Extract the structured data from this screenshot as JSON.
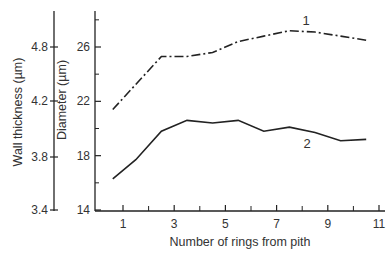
{
  "chart_data": {
    "type": "line",
    "title": "",
    "xlabel": "Number of rings from pith",
    "ylabel_left_outer": "Wall thickness (µm)",
    "ylabel_left_inner": "Diameter (µm)",
    "x_ticks": [
      1,
      3,
      5,
      7,
      9,
      11
    ],
    "x_minor_ticks": [
      2,
      4,
      6,
      8,
      10
    ],
    "xlim": [
      0,
      11
    ],
    "wall_thickness_ticks": [
      "3.4",
      "3.8",
      "4.2",
      "4.8"
    ],
    "diameter_ticks": [
      "14",
      "18",
      "22",
      "26"
    ],
    "diameter_minor_ticks": [
      16,
      20,
      24,
      28
    ],
    "ylim_diameter": [
      14,
      29
    ],
    "grid": false,
    "legend": "inline labels",
    "series": [
      {
        "name": "1",
        "axis": "Diameter (µm)",
        "style": "dash-dot",
        "x": [
          0.6,
          2.5,
          3.5,
          4.5,
          5.5,
          6.5,
          7.5,
          8.5,
          9.5,
          10.5
        ],
        "values": [
          21.4,
          25.3,
          25.3,
          25.6,
          26.4,
          26.8,
          27.2,
          27.1,
          26.8,
          26.5
        ]
      },
      {
        "name": "2",
        "axis": "Wall thickness (µm)",
        "style": "solid",
        "x": [
          0.6,
          1.5,
          2.5,
          3.5,
          4.5,
          5.5,
          6.5,
          7.5,
          8.5,
          9.5,
          10.5
        ],
        "values": [
          3.66,
          3.78,
          3.98,
          4.06,
          4.04,
          4.06,
          3.98,
          4.01,
          3.97,
          3.91,
          3.92
        ],
        "diameter_equivalent": [
          16.3,
          17.7,
          19.8,
          20.6,
          20.4,
          20.6,
          19.8,
          20.1,
          19.7,
          19.1,
          19.2
        ]
      }
    ]
  }
}
